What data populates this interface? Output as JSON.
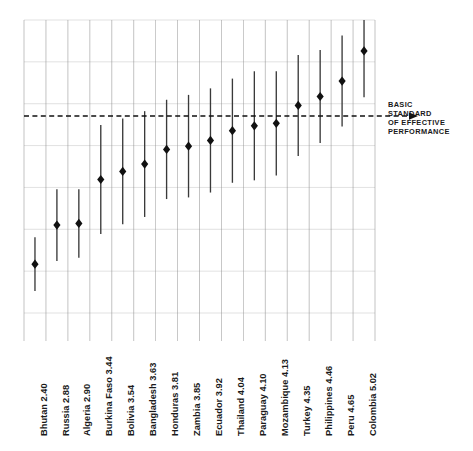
{
  "chart_data": {
    "type": "scatter",
    "title": "",
    "subtitle": "",
    "xlabel": "",
    "ylabel": "",
    "grid": true,
    "legend": "none",
    "ylim": [
      1.8,
      5.4
    ],
    "reference_line": {
      "value": 4.22,
      "style": "dashed",
      "label": "BASIC STANDARD OF EFFECTIVE PERFORMANCE",
      "label_lines": [
        "BASIC",
        "STANDARD",
        "OF EFFECTIVE",
        "PERFORMANCE"
      ],
      "arrow": "left"
    },
    "categories": [
      "Bhutan",
      "Russia",
      "Algeria",
      "Burkina Faso",
      "Bolivia",
      "Bangladesh",
      "Honduras",
      "Zambia",
      "Ecuador",
      "Thailand",
      "Paraguay",
      "Mozambique",
      "Turkey",
      "Philippines",
      "Peru",
      "Colombia"
    ],
    "values": [
      2.4,
      2.88,
      2.9,
      3.44,
      3.54,
      3.63,
      3.81,
      3.85,
      3.92,
      4.04,
      4.1,
      4.13,
      4.35,
      4.46,
      4.65,
      5.02
    ],
    "tick_labels": [
      "Bhutan  2.40",
      "Russia  2.88",
      "Algeria  2.90",
      "Burkina Faso  3.44",
      "Bolivia  3.54",
      "Bangladesh  3.63",
      "Honduras  3.81",
      "Zambia  3.85",
      "Ecuador  3.92",
      "Thailand  4.04",
      "Paraguay  4.10",
      "Mozambique  4.13",
      "Turkey  4.35",
      "Philippines  4.46",
      "Peru  4.65",
      "Colombia  5.02"
    ],
    "errors_low": [
      2.07,
      2.44,
      2.48,
      2.77,
      2.89,
      2.98,
      3.2,
      3.22,
      3.28,
      3.4,
      3.43,
      3.49,
      3.73,
      3.89,
      4.09,
      4.45
    ],
    "errors_high": [
      2.73,
      3.32,
      3.32,
      4.11,
      4.19,
      4.28,
      4.42,
      4.48,
      4.56,
      4.68,
      4.77,
      4.77,
      4.97,
      5.03,
      5.21,
      5.4
    ],
    "point_style": "diamond",
    "point_color": "#111111",
    "error_bar_color": "#3a3a3a",
    "gridline_color": "#d9d9d9",
    "separator_color": "#8a8a8a"
  }
}
